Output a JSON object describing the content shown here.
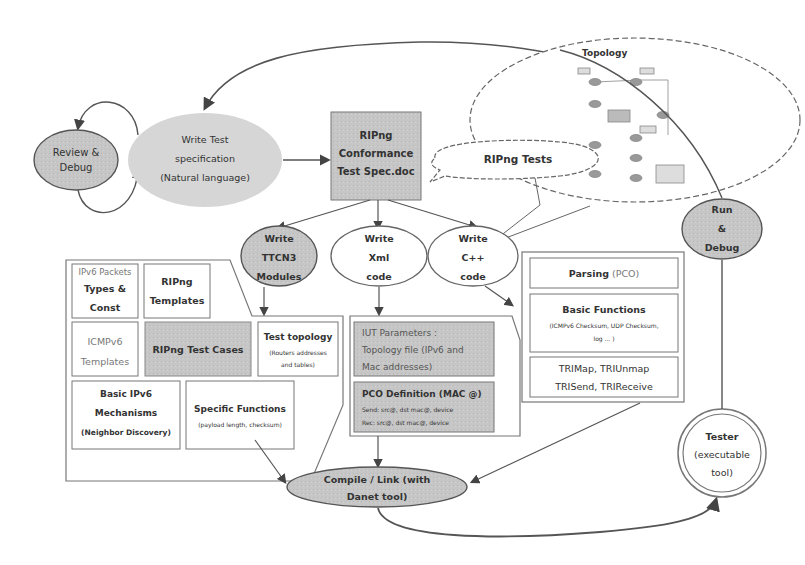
{
  "diagram": {
    "nodes": {
      "review_debug": {
        "line1": "Review &",
        "line2": "Debug"
      },
      "write_spec": {
        "line1": "Write Test",
        "line2": "specification",
        "line3": "(Natural language)"
      },
      "conformance_doc": {
        "line1": "RIPng",
        "line2": "Conformance",
        "line3": "Test Spec.doc"
      },
      "ripng_tests_callout": "RIPng Tests",
      "topology": {
        "title": "Topology"
      },
      "write_ttcn3": {
        "line1": "Write",
        "line2": "TTCN3",
        "line3": "Modules"
      },
      "write_xml": {
        "line1": "Write",
        "line2": "Xml",
        "line3": "code"
      },
      "write_cpp": {
        "line1": "Write",
        "line2": "C++",
        "line3": "code"
      },
      "run_debug": {
        "line1": "Run",
        "line2": "&",
        "line3": "Debug"
      },
      "compile_link": {
        "line1": "Compile / Link (with",
        "line2": "Danet tool)"
      },
      "tester": {
        "line1": "Tester",
        "line2": "(executable",
        "line3": "tool)"
      }
    },
    "ttcn3_group": {
      "ipv6_packets": {
        "top": "IPv6 Packets",
        "line1": "Types &",
        "line2": "Const"
      },
      "ripng_templates": {
        "line1": "RIPng",
        "line2": "Templates"
      },
      "icmpv6_templates": {
        "line1": "ICMPv6",
        "line2": "Templates"
      },
      "ripng_test_cases": "RIPng Test Cases",
      "test_topology": {
        "title": "Test topology",
        "sub1": "(Routers addresses",
        "sub2": "and tables)"
      },
      "basic_ipv6": {
        "line1": "Basic IPv6",
        "line2": "Mechanisms",
        "line3": "(Neighbor Discovery)"
      },
      "specific_functions": {
        "title": "Specific Functions",
        "sub": "(payload length, checksum)"
      }
    },
    "xml_group": {
      "iut_params": {
        "line1": "IUT Parameters :",
        "line2": "Topology file (IPv6 and",
        "line3": "Mac addresses)"
      },
      "pco_def": {
        "title": "PCO Definition (MAC @)",
        "send": "Send: src@, dst mac@, device",
        "rec": "Rec: src@, dst mac@, device"
      }
    },
    "cpp_group": {
      "parsing": {
        "bold": "Parsing",
        "normal": " (PCO)"
      },
      "basic_functions": {
        "title": "Basic Functions",
        "sub1": "(ICMPv6 Checksum, UDP Checksum,",
        "sub2": "log ... )"
      },
      "tri_line1": "TRIMap, TRIUnmap",
      "tri_line2": "TRISend, TRIReceive"
    },
    "colors": {
      "gray_fill": "#c4c4c4",
      "light_gray_fill": "#d6d6d6",
      "line": "#555555",
      "box_border": "#666666"
    }
  }
}
